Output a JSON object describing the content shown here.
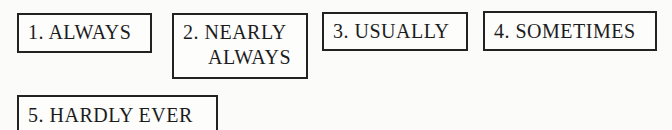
{
  "response_options": [
    {
      "number": "1.",
      "label": "ALWAYS",
      "text": "1. ALWAYS"
    },
    {
      "number": "2.",
      "label": "NEARLY ALWAYS",
      "line1": "2. NEARLY",
      "line2": "ALWAYS"
    },
    {
      "number": "3.",
      "label": "USUALLY",
      "text": "3. USUALLY"
    },
    {
      "number": "4.",
      "label": "SOMETIMES",
      "text": "4. SOMETIMES"
    },
    {
      "number": "5.",
      "label": "HARDLY EVER",
      "text": "5. HARDLY EVER"
    }
  ]
}
